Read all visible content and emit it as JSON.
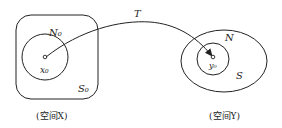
{
  "diagram": {
    "space_x": {
      "caption": "(空间X)",
      "set_label": "S₀",
      "neighborhood_label": "N₀",
      "point_label": "x₀"
    },
    "space_y": {
      "caption": "(空间Y)",
      "set_label": "S",
      "neighborhood_label": "N",
      "point_label": "y₀"
    },
    "mapping_label": "T",
    "colors": {
      "stroke": "#222222",
      "background": "#ffffff"
    }
  }
}
